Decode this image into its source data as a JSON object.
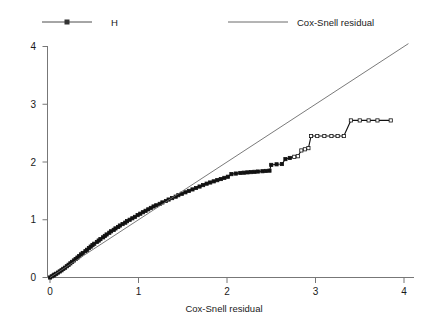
{
  "chart_data": {
    "type": "line",
    "title": "",
    "xlabel": "Cox-Snell residual",
    "ylabel": "",
    "xlim": [
      0,
      4.2
    ],
    "ylim": [
      0,
      4.2
    ],
    "xticks": [
      0,
      1,
      2,
      3,
      4
    ],
    "yticks": [
      0,
      1,
      2,
      3,
      4
    ],
    "xtick_labels": [
      "0",
      "1",
      "2",
      "3",
      "4"
    ],
    "ytick_labels": [
      "0",
      "1",
      "2",
      "3",
      "4"
    ],
    "grid": false,
    "legend_position": "top",
    "legend": [
      {
        "name": "H",
        "marker": "square",
        "line": true,
        "color": "#4d4d4d"
      },
      {
        "name": "Cox-Snell residual",
        "marker": "none",
        "line": true,
        "color": "#6b6b6b"
      }
    ],
    "series": [
      {
        "name": "H",
        "type": "step-line-markers",
        "color": "#111111",
        "marker": "square",
        "points": [
          [
            0.0,
            0.0
          ],
          [
            0.02,
            0.02
          ],
          [
            0.04,
            0.035
          ],
          [
            0.05,
            0.05
          ],
          [
            0.07,
            0.065
          ],
          [
            0.09,
            0.085
          ],
          [
            0.11,
            0.105
          ],
          [
            0.13,
            0.125
          ],
          [
            0.15,
            0.15
          ],
          [
            0.17,
            0.17
          ],
          [
            0.19,
            0.195
          ],
          [
            0.21,
            0.22
          ],
          [
            0.23,
            0.245
          ],
          [
            0.25,
            0.27
          ],
          [
            0.27,
            0.295
          ],
          [
            0.29,
            0.32
          ],
          [
            0.31,
            0.345
          ],
          [
            0.33,
            0.37
          ],
          [
            0.35,
            0.4
          ],
          [
            0.37,
            0.425
          ],
          [
            0.4,
            0.455
          ],
          [
            0.42,
            0.48
          ],
          [
            0.44,
            0.51
          ],
          [
            0.46,
            0.535
          ],
          [
            0.48,
            0.56
          ],
          [
            0.5,
            0.585
          ],
          [
            0.53,
            0.615
          ],
          [
            0.55,
            0.64
          ],
          [
            0.57,
            0.665
          ],
          [
            0.6,
            0.695
          ],
          [
            0.62,
            0.72
          ],
          [
            0.64,
            0.745
          ],
          [
            0.67,
            0.775
          ],
          [
            0.69,
            0.8
          ],
          [
            0.72,
            0.825
          ],
          [
            0.74,
            0.85
          ],
          [
            0.77,
            0.875
          ],
          [
            0.79,
            0.9
          ],
          [
            0.82,
            0.925
          ],
          [
            0.85,
            0.95
          ],
          [
            0.87,
            0.975
          ],
          [
            0.9,
            1.0
          ],
          [
            0.93,
            1.025
          ],
          [
            0.96,
            1.05
          ],
          [
            0.99,
            1.08
          ],
          [
            1.02,
            1.105
          ],
          [
            1.05,
            1.13
          ],
          [
            1.08,
            1.155
          ],
          [
            1.11,
            1.18
          ],
          [
            1.14,
            1.205
          ],
          [
            1.17,
            1.23
          ],
          [
            1.2,
            1.25
          ],
          [
            1.24,
            1.275
          ],
          [
            1.27,
            1.3
          ],
          [
            1.31,
            1.325
          ],
          [
            1.34,
            1.35
          ],
          [
            1.38,
            1.375
          ],
          [
            1.42,
            1.4
          ],
          [
            1.45,
            1.425
          ],
          [
            1.49,
            1.45
          ],
          [
            1.53,
            1.475
          ],
          [
            1.57,
            1.5
          ],
          [
            1.61,
            1.525
          ],
          [
            1.65,
            1.55
          ],
          [
            1.69,
            1.575
          ],
          [
            1.73,
            1.6
          ],
          [
            1.77,
            1.625
          ],
          [
            1.81,
            1.645
          ],
          [
            1.85,
            1.665
          ],
          [
            1.89,
            1.685
          ],
          [
            1.93,
            1.705
          ],
          [
            1.97,
            1.725
          ],
          [
            2.01,
            1.745
          ],
          [
            2.05,
            1.79
          ],
          [
            2.1,
            1.8
          ],
          [
            2.15,
            1.81
          ],
          [
            2.19,
            1.815
          ],
          [
            2.23,
            1.82
          ],
          [
            2.27,
            1.825
          ],
          [
            2.31,
            1.83
          ],
          [
            2.35,
            1.835
          ],
          [
            2.4,
            1.84
          ],
          [
            2.44,
            1.845
          ],
          [
            2.48,
            1.85
          ],
          [
            2.5,
            1.95
          ],
          [
            2.56,
            1.96
          ],
          [
            2.62,
            1.965
          ],
          [
            2.66,
            2.05
          ],
          [
            2.71,
            2.07
          ],
          [
            2.76,
            2.09
          ],
          [
            2.8,
            2.1
          ],
          [
            2.84,
            2.2
          ],
          [
            2.88,
            2.22
          ],
          [
            2.92,
            2.24
          ],
          [
            2.95,
            2.45
          ],
          [
            3.02,
            2.45
          ],
          [
            3.1,
            2.45
          ],
          [
            3.18,
            2.45
          ],
          [
            3.25,
            2.45
          ],
          [
            3.32,
            2.45
          ],
          [
            3.4,
            2.72
          ],
          [
            3.5,
            2.72
          ],
          [
            3.6,
            2.72
          ],
          [
            3.7,
            2.72
          ],
          [
            3.85,
            2.72
          ]
        ]
      },
      {
        "name": "Cox-Snell residual",
        "type": "reference-line",
        "color": "#6b6b6b",
        "points": [
          [
            0.0,
            0.0
          ],
          [
            4.05,
            4.05
          ]
        ]
      }
    ]
  }
}
